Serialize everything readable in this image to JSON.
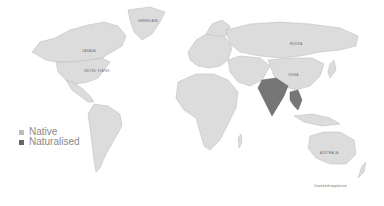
{
  "map": {
    "title": "",
    "country_labels": [
      "GREENLAND",
      "CANADA",
      "UNITED STATES",
      "RUSSIA",
      "CHINA",
      "AUSTRALIA"
    ],
    "colors": {
      "native": "#c4c4c4",
      "naturalised": "#666666",
      "land_default": "#dcdcdc",
      "background": "#ffffff"
    },
    "highlighted_regions": {
      "naturalised": [
        "India",
        "Indochina"
      ]
    }
  },
  "legend": {
    "items": [
      {
        "label": "Native",
        "color": "#bdbdbd"
      },
      {
        "label": "Naturalised",
        "color": "#666666"
      }
    ]
  },
  "credit": "Created with mapchart.net"
}
